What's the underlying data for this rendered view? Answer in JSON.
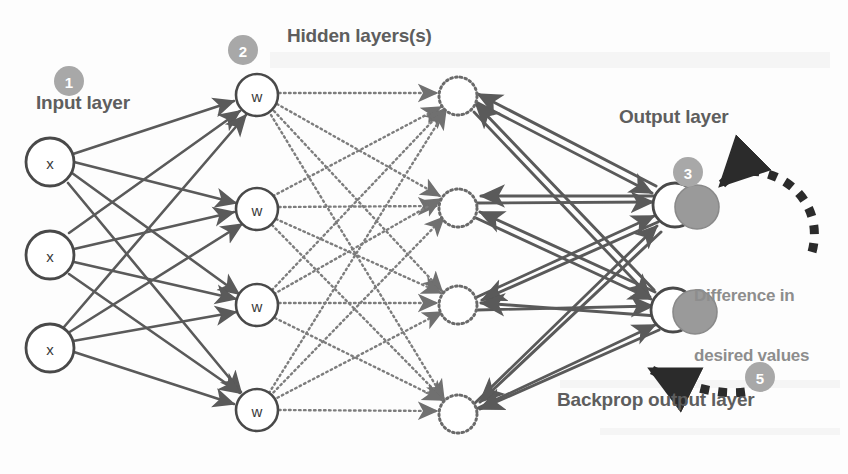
{
  "figure": {
    "background": "#fdfdfd",
    "width": 848,
    "height": 474
  },
  "colors": {
    "node_stroke": "#4a4a4a",
    "node_fill": "#ffffff",
    "node_text": "#3a3a3a",
    "solid_arrow": "#5a5a5a",
    "dotted_arrow": "#7d7d7d",
    "dashed_arrow": "#2b2b2b",
    "badge_fill": "#a8a8a8",
    "badge_text": "#ffffff",
    "label_text": "#5e5e5e",
    "muted_text": "#8d8d8d",
    "output_shadow_fill": "#9a9a9a"
  },
  "labels": {
    "input_layer": "Input layer",
    "hidden_layers": "Hidden layers(s)",
    "output_layer": "Output layer",
    "difference_line1": "Difference in",
    "difference_line2": "desired values",
    "backprop": "Backprop output layer"
  },
  "badges": [
    {
      "id": "badge-1",
      "number": "1",
      "cx": 69,
      "cy": 81,
      "r": 15
    },
    {
      "id": "badge-2",
      "number": "2",
      "cx": 243,
      "cy": 50,
      "r": 15
    },
    {
      "id": "badge-3",
      "number": "3",
      "cx": 688,
      "cy": 172,
      "r": 15
    },
    {
      "id": "badge-5",
      "number": "5",
      "cx": 760,
      "cy": 377,
      "r": 15
    }
  ],
  "layers": [
    {
      "name": "input-layer",
      "style": "solid",
      "node_label": "x",
      "radius": 24,
      "nodes": [
        {
          "cx": 50,
          "cy": 162,
          "label": "x"
        },
        {
          "cx": 50,
          "cy": 255,
          "label": "x"
        },
        {
          "cx": 50,
          "cy": 348,
          "label": "x"
        }
      ]
    },
    {
      "name": "hidden-layer-1",
      "style": "solid",
      "node_label": "w",
      "radius": 21,
      "nodes": [
        {
          "cx": 257,
          "cy": 95,
          "label": "w"
        },
        {
          "cx": 257,
          "cy": 209,
          "label": "w"
        },
        {
          "cx": 257,
          "cy": 305,
          "label": "w"
        },
        {
          "cx": 257,
          "cy": 410,
          "label": "w"
        }
      ]
    },
    {
      "name": "hidden-layer-2",
      "style": "dotted",
      "node_label": "",
      "radius": 19,
      "nodes": [
        {
          "cx": 458,
          "cy": 96,
          "label": ""
        },
        {
          "cx": 458,
          "cy": 208,
          "label": ""
        },
        {
          "cx": 458,
          "cy": 305,
          "label": ""
        },
        {
          "cx": 458,
          "cy": 414,
          "label": ""
        }
      ]
    },
    {
      "name": "output-layer",
      "style": "solid",
      "node_label": "",
      "radius": 22,
      "nodes": [
        {
          "cx": 675,
          "cy": 205,
          "label": "",
          "shadow_cx": 697,
          "shadow_cy": 207,
          "shadow_r": 22
        },
        {
          "cx": 673,
          "cy": 310,
          "label": "",
          "shadow_cx": 695,
          "shadow_cy": 312,
          "shadow_r": 22
        }
      ]
    }
  ],
  "connections": {
    "input_to_hidden1": {
      "style": "solid",
      "direction": "forward",
      "description": "fully connected, 3 inputs to 4 weight nodes, arrowheads at hidden layer"
    },
    "hidden1_to_hidden2": {
      "style": "dotted",
      "direction": "forward",
      "description": "fully connected, 4 to 4, arrowheads at hidden layer 2"
    },
    "hidden2_to_output": {
      "style": "solid",
      "direction": "bidirectional",
      "description": "fully connected, 4 hidden nodes to 2 output nodes, forward and backward arrows"
    }
  },
  "annotations": [
    {
      "id": "difference-arrow",
      "style": "dashed-curve",
      "description": "thick dashed curved arrow pointing left into the top output node shadow"
    },
    {
      "id": "backprop-arrow",
      "style": "dashed-curve",
      "description": "thick dashed curved arrow pointing left toward the network, from badge 5"
    }
  ]
}
